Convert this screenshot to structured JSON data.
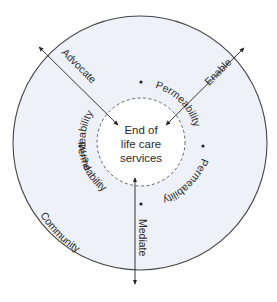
{
  "diagram": {
    "center": {
      "lines": [
        "End of",
        "life care",
        "services"
      ]
    },
    "outer_ring_label": "Community",
    "permeability_labels": [
      "Permeability",
      "Permeability",
      "Permeability",
      "Permeability"
    ],
    "arrows": [
      {
        "label": "Advocate",
        "direction": "bidirectional"
      },
      {
        "label": "Enable",
        "direction": "bidirectional"
      },
      {
        "label": "Mediate",
        "direction": "bidirectional"
      }
    ],
    "colors": {
      "outer_fill": "#eef1f7",
      "inner_fill": "#ffffff",
      "stroke": "#333333",
      "dashed": "#555555",
      "text": "#2a2a2a"
    }
  }
}
